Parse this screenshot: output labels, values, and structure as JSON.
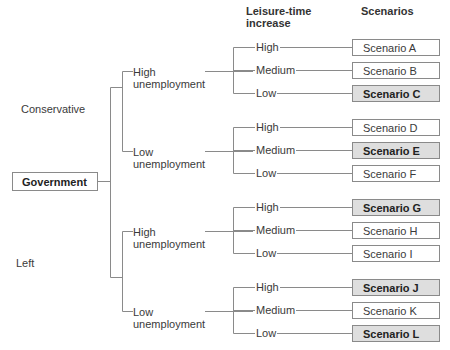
{
  "headers": {
    "leisure": "Leisure-time increase",
    "leisure_line1": "Leisure-time",
    "leisure_line2": "increase",
    "scenarios": "Scenarios"
  },
  "root": {
    "label": "Government"
  },
  "parties": [
    {
      "label": "Conservative"
    },
    {
      "label": "Left"
    }
  ],
  "unemployment": [
    {
      "line1": "High",
      "line2": "unemployment"
    },
    {
      "line1": "Low",
      "line2": "unemployment"
    },
    {
      "line1": "High",
      "line2": "unemployment"
    },
    {
      "line1": "Low",
      "line2": "unemployment"
    }
  ],
  "leisure_levels": [
    "High",
    "Medium",
    "Low",
    "High",
    "Medium",
    "Low",
    "High",
    "Medium",
    "Low",
    "High",
    "Medium",
    "Low"
  ],
  "scenarios": [
    {
      "label": "Scenario A",
      "highlighted": false
    },
    {
      "label": "Scenario B",
      "highlighted": false
    },
    {
      "label": "Scenario C",
      "highlighted": true
    },
    {
      "label": "Scenario D",
      "highlighted": false
    },
    {
      "label": "Scenario E",
      "highlighted": true
    },
    {
      "label": "Scenario F",
      "highlighted": false
    },
    {
      "label": "Scenario G",
      "highlighted": true
    },
    {
      "label": "Scenario H",
      "highlighted": false
    },
    {
      "label": "Scenario I",
      "highlighted": false
    },
    {
      "label": "Scenario J",
      "highlighted": true
    },
    {
      "label": "Scenario K",
      "highlighted": false
    },
    {
      "label": "Scenario L",
      "highlighted": true
    }
  ],
  "colors": {
    "line": "#8a8a8a",
    "highlight_fill": "#dedede",
    "text": "#3a3a3a"
  }
}
